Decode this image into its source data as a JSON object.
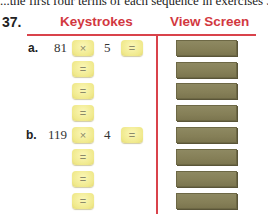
{
  "intro_text_cut": "...the first four terms of each sequence in exercises 37 an...",
  "exercise": {
    "number": "37.",
    "headers": {
      "keystrokes": "Keystrokes",
      "view_screen": "View Screen"
    },
    "colors": {
      "accent_red": "#d2383f",
      "key_yellow": "#f0e98c",
      "screen_olive": "#857f57"
    },
    "parts": [
      {
        "label": "a.",
        "first_value": "81",
        "operator": "×",
        "second_value": "5",
        "keys": [
          "=",
          "=",
          "=",
          "="
        ]
      },
      {
        "label": "b.",
        "first_value": "119",
        "operator": "×",
        "second_value": "4",
        "keys": [
          "=",
          "=",
          "=",
          "="
        ]
      }
    ]
  }
}
